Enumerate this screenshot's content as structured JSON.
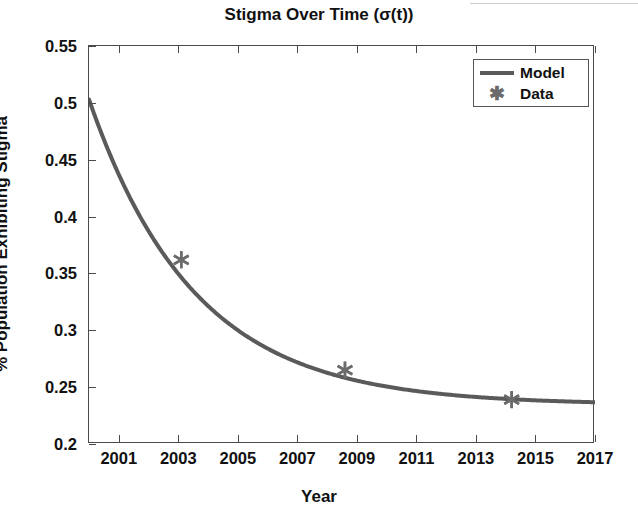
{
  "figure": {
    "title": "Stigma Over Time (σ(t))",
    "background": "#ffffff",
    "line_color": "#5a5a5a",
    "marker_color": "#6b6b6b",
    "axis_color": "#4a4a4a"
  },
  "legend": {
    "position": "top-right",
    "entries": [
      {
        "label": "Model",
        "key": "line",
        "icon": "line-swatch"
      },
      {
        "label": "Data",
        "key": "marker",
        "icon": "asterisk-marker"
      }
    ]
  },
  "chart_data": {
    "type": "line",
    "title": "Stigma Over Time (σ(t))",
    "xlabel": "Year",
    "ylabel": "% Population Exhibiting Stigma",
    "xlim": [
      2000,
      2017
    ],
    "ylim": [
      0.2,
      0.55
    ],
    "grid": false,
    "xticks": [
      2001,
      2003,
      2005,
      2007,
      2009,
      2011,
      2013,
      2015,
      2017
    ],
    "xticklabels": [
      "2001",
      "2003",
      "2005",
      "2007",
      "2009",
      "2011",
      "2013",
      "2015",
      "2017"
    ],
    "yticks": [
      0.2,
      0.25,
      0.3,
      0.35,
      0.4,
      0.45,
      0.5,
      0.55
    ],
    "yticklabels": [
      "0.2",
      "0.25",
      "0.3",
      "0.35",
      "0.4",
      "0.45",
      "0.5",
      "0.55"
    ],
    "series": [
      {
        "name": "Model",
        "type": "line",
        "x": [
          2000.0,
          2000.4,
          2000.8,
          2001.2,
          2001.6,
          2002.0,
          2002.4,
          2002.8,
          2003.2,
          2003.6,
          2004.0,
          2004.4,
          2004.8,
          2005.2,
          2005.6,
          2006.0,
          2006.4,
          2006.8,
          2007.2,
          2007.6,
          2008.0,
          2008.4,
          2008.8,
          2009.2,
          2009.6,
          2010.0,
          2010.4,
          2010.8,
          2011.2,
          2011.6,
          2012.0,
          2012.4,
          2012.8,
          2013.2,
          2013.6,
          2014.0,
          2014.4,
          2014.8,
          2015.2,
          2015.6,
          2016.0,
          2016.4,
          2016.8,
          2017.0
        ],
        "y": [
          0.503,
          0.4887,
          0.4759,
          0.4644,
          0.4542,
          0.445,
          0.4368,
          0.4295,
          0.4229,
          0.4171,
          0.4118,
          0.4071,
          0.4029,
          0.3992,
          0.3958,
          0.3928,
          0.3901,
          0.3877,
          0.3855,
          0.3836,
          0.3819,
          0.3804,
          0.379,
          0.3778,
          0.3767,
          0.3757,
          0.3748,
          0.374,
          0.3733,
          0.3727,
          0.3721,
          0.3716,
          0.3712,
          0.3708,
          0.3704,
          0.3701,
          0.3698,
          0.3696,
          0.3694,
          0.3692,
          0.369,
          0.3688,
          0.3687,
          0.3686
        ]
      },
      {
        "name": "Data",
        "type": "scatter",
        "marker": "asterisk",
        "x": [
          2003.1,
          2008.6,
          2014.2
        ],
        "y": [
          0.362,
          0.265,
          0.239
        ]
      }
    ],
    "model_fit": {
      "form": "sigma(t) = c + a*exp(-k*(t-2000))",
      "c": 0.2345,
      "a": 0.2685,
      "k": 0.282
    }
  }
}
